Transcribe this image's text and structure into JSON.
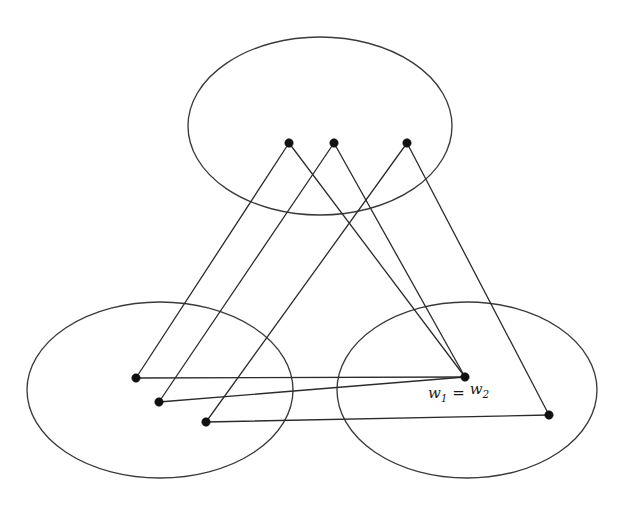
{
  "figure": {
    "background_color": "#ffffff",
    "stroke_color": "#2b2b2b",
    "ellipse_stroke_color": "#3a3a3a",
    "vertex_color": "#111111"
  },
  "sets": [
    {
      "id": "A",
      "label": "A",
      "label_x": 215,
      "label_y": 42,
      "cx": 320,
      "cy": 126,
      "rx": 132,
      "ry": 89
    },
    {
      "id": "B",
      "label": "B",
      "label_x": 48,
      "label_y": 322,
      "cx": 160,
      "cy": 390,
      "rx": 133,
      "ry": 88
    },
    {
      "id": "C",
      "label": "C",
      "label_x": 580,
      "label_y": 322,
      "cx": 467,
      "cy": 390,
      "rx": 130,
      "ry": 88
    }
  ],
  "vertices": [
    {
      "id": "u1",
      "set": "A",
      "x": 289,
      "y": 143,
      "base": "u",
      "subscript": "1",
      "label_x": 282,
      "label_y": 130,
      "label_anchor": "middle"
    },
    {
      "id": "u2",
      "set": "A",
      "x": 334,
      "y": 143,
      "base": "u",
      "subscript": "2",
      "label_x": 328,
      "label_y": 130,
      "label_anchor": "middle"
    },
    {
      "id": "ur",
      "set": "A",
      "x": 407,
      "y": 143,
      "base": "u",
      "subscript": "r",
      "label_x": 418,
      "label_y": 130,
      "label_anchor": "middle"
    },
    {
      "id": "v1",
      "set": "B",
      "x": 136,
      "y": 378,
      "base": "v",
      "subscript": "1",
      "label_x": 119,
      "label_y": 366,
      "label_anchor": "middle"
    },
    {
      "id": "v2",
      "set": "B",
      "x": 159,
      "y": 402,
      "base": "v",
      "subscript": "2",
      "label_x": 139,
      "label_y": 405,
      "label_anchor": "middle"
    },
    {
      "id": "vr",
      "set": "B",
      "x": 206,
      "y": 422,
      "base": "v",
      "subscript": "r",
      "label_x": 203,
      "label_y": 443,
      "label_anchor": "middle"
    },
    {
      "id": "w1w2",
      "set": "C",
      "x": 465,
      "y": 377,
      "base": "w",
      "subscript": "1",
      "label_x": 465,
      "label_y": 398,
      "label_anchor": "middle",
      "compound_label": "w1 = w2"
    },
    {
      "id": "wr",
      "set": "C",
      "x": 549,
      "y": 415,
      "base": "w",
      "subscript": "r",
      "label_x": 554,
      "label_y": 439,
      "label_anchor": "middle"
    }
  ],
  "compound_labels": [
    {
      "id": "w1-eq-w2",
      "parts": [
        "w",
        "1",
        "=",
        "w",
        "2"
      ],
      "text": "w1 = w2",
      "x": 428,
      "y": 398
    }
  ],
  "ellipses_dots": [
    {
      "id": "dots-A",
      "text": "...",
      "x": 370,
      "y": 146
    },
    {
      "id": "dots-B",
      "text": "...",
      "x": 181,
      "y": 414
    },
    {
      "id": "dots-C",
      "text": "...",
      "x": 510,
      "y": 406
    }
  ],
  "edges": [
    {
      "id": "u1-v1",
      "from": "u1",
      "to": "v1"
    },
    {
      "id": "u2-v2",
      "from": "u2",
      "to": "v2"
    },
    {
      "id": "ur-vr",
      "from": "ur",
      "to": "vr"
    },
    {
      "id": "u1-w1",
      "from": "u1",
      "to": "w1w2"
    },
    {
      "id": "u2-w2",
      "from": "u2",
      "to": "w1w2"
    },
    {
      "id": "ur-wr",
      "from": "ur",
      "to": "wr"
    },
    {
      "id": "v1-w1",
      "from": "v1",
      "to": "w1w2"
    },
    {
      "id": "v2-w2",
      "from": "v2",
      "to": "w1w2"
    },
    {
      "id": "vr-wr",
      "from": "vr",
      "to": "wr"
    }
  ]
}
